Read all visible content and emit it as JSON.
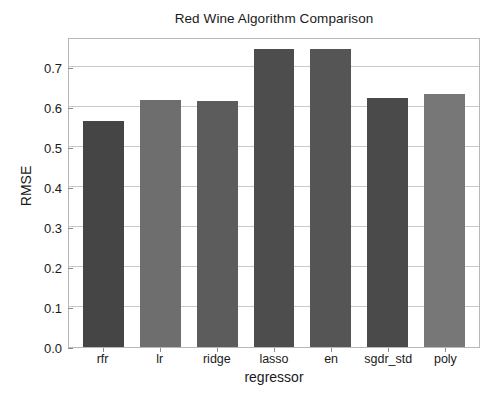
{
  "chart_data": {
    "type": "bar",
    "title": "Red Wine Algorithm Comparison",
    "xlabel": "regressor",
    "ylabel": "RMSE",
    "categories": [
      "rfr",
      "lr",
      "ridge",
      "lasso",
      "en",
      "sgdr_std",
      "poly"
    ],
    "values": [
      0.565,
      0.618,
      0.615,
      0.745,
      0.745,
      0.622,
      0.633
    ],
    "bar_colors": [
      "#454545",
      "#6e6e6e",
      "#5c5c5c",
      "#4d4d4d",
      "#555555",
      "#4a4a4a",
      "#777777"
    ],
    "ylim": [
      0.0,
      0.775
    ],
    "ytick_labels": [
      "0.0",
      "0.1",
      "0.2",
      "0.3",
      "0.4",
      "0.5",
      "0.6",
      "0.7"
    ],
    "ytick_values": [
      0.0,
      0.1,
      0.2,
      0.3,
      0.4,
      0.5,
      0.6,
      0.7
    ],
    "grid": true,
    "grid_axis": "y",
    "legend": null,
    "annotations": []
  }
}
